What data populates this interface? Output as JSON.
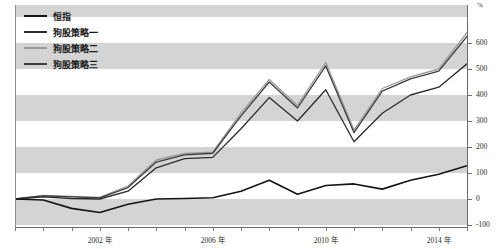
{
  "legend": {
    "position": "top-left",
    "items": [
      {
        "label": "恒指",
        "color": "#141414",
        "width": 2.0
      },
      {
        "label": "狗股策略一",
        "color": "#2b2b2b",
        "width": 2.0
      },
      {
        "label": "狗股策略二",
        "color": "#9a9a9a",
        "width": 2.0
      },
      {
        "label": "狗股策略三",
        "color": "#3d3d3d",
        "width": 2.0
      }
    ]
  },
  "axes": {
    "y_unit_label": "%",
    "y_ticks": [
      600,
      500,
      400,
      300,
      200,
      100,
      0,
      -100
    ],
    "y_tick_labels": [
      "600",
      "500",
      "400",
      "300",
      "200",
      "100",
      "0",
      "-100"
    ],
    "x_tick_labels": [
      "2002 年",
      "2006 年",
      "2010 年",
      "2014 年"
    ],
    "x_label_years": [
      2002,
      2006,
      2010,
      2014
    ]
  },
  "chart_data": {
    "type": "line",
    "title": "",
    "subtitle": "",
    "xlabel": "",
    "ylabel": "%",
    "xlim": [
      1999,
      2015
    ],
    "ylim": [
      -100,
      660
    ],
    "grid": "horizontal-banding",
    "legend_position": "top-left",
    "x": [
      1999,
      2000,
      2001,
      2002,
      2003,
      2004,
      2005,
      2006,
      2007,
      2008,
      2009,
      2010,
      2011,
      2012,
      2013,
      2014,
      2015
    ],
    "series": [
      {
        "name": "恒指",
        "color": "#141414",
        "values": [
          0,
          -4,
          -36,
          -52,
          -20,
          0,
          2,
          5,
          30,
          72,
          18,
          52,
          58,
          38,
          72,
          95,
          128
        ]
      },
      {
        "name": "狗股策略一",
        "color": "#2b2b2b",
        "values": [
          0,
          8,
          2,
          0,
          30,
          120,
          155,
          160,
          270,
          390,
          300,
          420,
          220,
          330,
          400,
          430,
          520
        ]
      },
      {
        "name": "狗股策略二",
        "color": "#9a9a9a",
        "values": [
          0,
          14,
          10,
          6,
          50,
          150,
          175,
          180,
          330,
          460,
          360,
          525,
          265,
          425,
          470,
          500,
          640
        ]
      },
      {
        "name": "狗股策略三",
        "color": "#3d3d3d",
        "values": [
          0,
          12,
          8,
          4,
          44,
          142,
          170,
          176,
          320,
          450,
          350,
          512,
          255,
          415,
          462,
          492,
          625
        ]
      }
    ]
  }
}
